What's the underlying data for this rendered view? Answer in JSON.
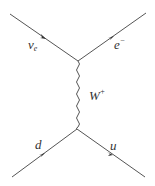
{
  "diagram": {
    "type": "feynman",
    "colors": {
      "line": "#555555",
      "background": "#ffffff",
      "text": "#333333"
    },
    "vertices": {
      "top": [
        78,
        61
      ],
      "bottom": [
        77,
        129
      ]
    },
    "particles": {
      "nu_e": {
        "symbol": "ν",
        "sub": "e",
        "sup": ""
      },
      "electron": {
        "symbol": "e",
        "sub": "",
        "sup": "−"
      },
      "w_boson": {
        "symbol": "W",
        "sub": "",
        "sup": "+"
      },
      "down": {
        "symbol": "d",
        "sub": "",
        "sup": ""
      },
      "up": {
        "symbol": "u",
        "sub": "",
        "sup": ""
      }
    }
  }
}
